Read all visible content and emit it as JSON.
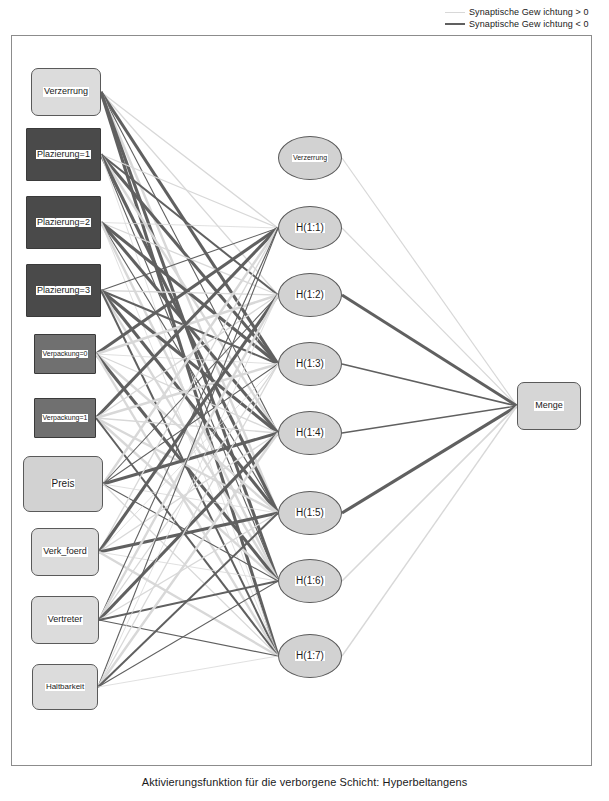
{
  "legend": {
    "positive_label": "Synaptische Gew ichtung > 0",
    "negative_label": "Synaptische Gew ichtung < 0",
    "positive_color": "#d8d8d8",
    "negative_color": "#606060"
  },
  "caption": "Aktivierungsfunktion für die verborgene Schicht: Hyperbeltangens",
  "diagram": {
    "type": "neural-network",
    "layers": [
      "input",
      "hidden",
      "output"
    ],
    "input_layer": {
      "name": "Eingabeschicht",
      "nodes": [
        {
          "label": "Verzerrung",
          "x": 30,
          "y": 67,
          "w": 70,
          "h": 48,
          "fill": "#dcdcdc",
          "shape": "rounded",
          "font": 9
        },
        {
          "label": "Plazierung=1",
          "x": 25,
          "y": 127,
          "w": 75,
          "h": 53,
          "fill": "#4a4a4a",
          "shape": "square",
          "font": 9
        },
        {
          "label": "Plazierung=2",
          "x": 25,
          "y": 195,
          "w": 75,
          "h": 53,
          "fill": "#4a4a4a",
          "shape": "square",
          "font": 9
        },
        {
          "label": "Plazierung=3",
          "x": 25,
          "y": 263,
          "w": 75,
          "h": 53,
          "fill": "#4a4a4a",
          "shape": "square",
          "font": 9
        },
        {
          "label": "Verpackung=0",
          "x": 33,
          "y": 333,
          "w": 62,
          "h": 40,
          "fill": "#707070",
          "shape": "square",
          "font": 7
        },
        {
          "label": "Verpackung=1",
          "x": 33,
          "y": 397,
          "w": 62,
          "h": 40,
          "fill": "#707070",
          "shape": "square",
          "font": 7
        },
        {
          "label": "Preis",
          "x": 22,
          "y": 455,
          "w": 80,
          "h": 56,
          "fill": "#d2d2d2",
          "shape": "rounded",
          "font": 10
        },
        {
          "label": "Verk_foerd",
          "x": 30,
          "y": 527,
          "w": 68,
          "h": 48,
          "fill": "#dcdcdc",
          "shape": "rounded",
          "font": 9
        },
        {
          "label": "Vertreter",
          "x": 30,
          "y": 595,
          "w": 68,
          "h": 48,
          "fill": "#dcdcdc",
          "shape": "rounded",
          "font": 9
        },
        {
          "label": "Haltbarkeit",
          "x": 31,
          "y": 663,
          "w": 66,
          "h": 46,
          "fill": "#dcdcdc",
          "shape": "rounded",
          "font": 8
        }
      ]
    },
    "hidden_layer": {
      "name": "Verborgene Schicht",
      "activation": "Hyperbeltangens",
      "nodes": [
        {
          "label": "Verzerrung",
          "x": 277,
          "y": 135,
          "w": 64,
          "h": 44,
          "font": 7
        },
        {
          "label": "H(1:1)",
          "x": 277,
          "y": 205,
          "w": 64,
          "h": 44,
          "font": 10
        },
        {
          "label": "H(1:2)",
          "x": 277,
          "y": 272,
          "w": 64,
          "h": 44,
          "font": 10
        },
        {
          "label": "H(1:3)",
          "x": 277,
          "y": 341,
          "w": 64,
          "h": 44,
          "font": 10
        },
        {
          "label": "H(1:4)",
          "x": 277,
          "y": 410,
          "w": 64,
          "h": 44,
          "font": 10
        },
        {
          "label": "H(1:5)",
          "x": 277,
          "y": 490,
          "w": 64,
          "h": 44,
          "font": 10
        },
        {
          "label": "H(1:6)",
          "x": 277,
          "y": 558,
          "w": 64,
          "h": 44,
          "font": 10
        },
        {
          "label": "H(1:7)",
          "x": 277,
          "y": 633,
          "w": 64,
          "h": 44,
          "font": 10
        }
      ]
    },
    "output_layer": {
      "name": "Ausgabeschicht",
      "nodes": [
        {
          "label": "Menge",
          "x": 516,
          "y": 381,
          "w": 64,
          "h": 48,
          "font": 9
        }
      ]
    },
    "hidden_to_output_edges": [
      {
        "from": "Verzerrung",
        "sign": "positive",
        "width": 1.2
      },
      {
        "from": "H(1:1)",
        "sign": "positive",
        "width": 1.2
      },
      {
        "from": "H(1:2)",
        "sign": "negative",
        "width": 3.0
      },
      {
        "from": "H(1:3)",
        "sign": "negative",
        "width": 1.6
      },
      {
        "from": "H(1:4)",
        "sign": "negative",
        "width": 1.4
      },
      {
        "from": "H(1:5)",
        "sign": "negative",
        "width": 3.2
      },
      {
        "from": "H(1:6)",
        "sign": "positive",
        "width": 1.6
      },
      {
        "from": "H(1:7)",
        "sign": "positive",
        "width": 1.4
      }
    ]
  }
}
